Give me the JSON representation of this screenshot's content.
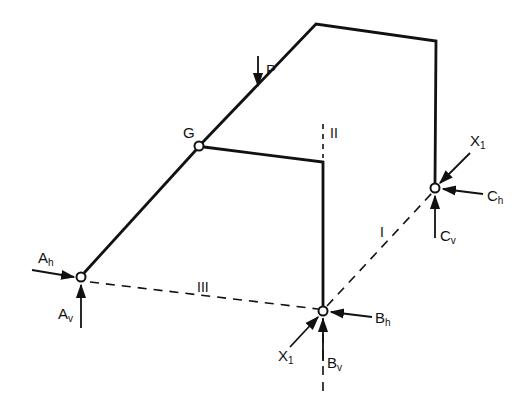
{
  "diagram": {
    "type": "structural frame with hinges and support reactions",
    "colors": {
      "line": "#111111",
      "background": "#ffffff"
    },
    "labels": {
      "load": "P",
      "hinge": "G",
      "A_h": {
        "main": "A",
        "sub": "h"
      },
      "A_v": {
        "main": "A",
        "sub": "v"
      },
      "B_h": {
        "main": "B",
        "sub": "h"
      },
      "B_v": {
        "main": "B",
        "sub": "v"
      },
      "C_h": {
        "main": "C",
        "sub": "h"
      },
      "C_v": {
        "main": "C",
        "sub": "v"
      },
      "X1_B": {
        "main": "X",
        "sub": "1"
      },
      "X1_C": {
        "main": "X",
        "sub": "1"
      },
      "axis_I": "I",
      "axis_II": "II",
      "axis_III": "III"
    },
    "nodes": [
      {
        "id": "A",
        "x": 81,
        "y": 277
      },
      {
        "id": "G",
        "x": 199,
        "y": 146
      },
      {
        "id": "B",
        "x": 323,
        "y": 311
      },
      {
        "id": "C",
        "x": 435,
        "y": 188
      }
    ]
  }
}
